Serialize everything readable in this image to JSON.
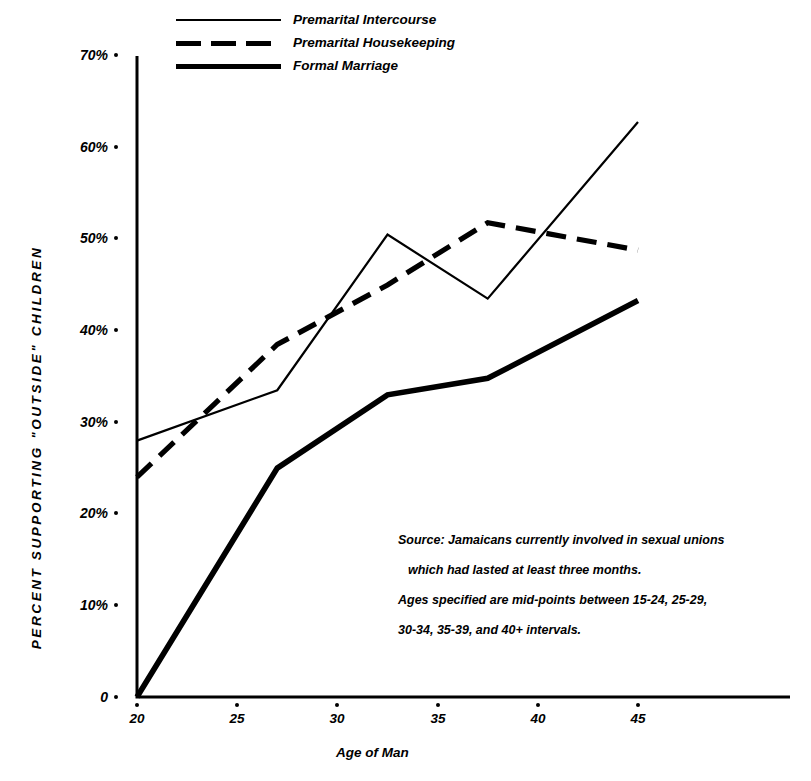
{
  "chart_data": {
    "type": "line",
    "title": "",
    "xlabel": "Age of Man",
    "ylabel": "PERCENT SUPPORTING \"OUTSIDE\" CHILDREN",
    "x": [
      20,
      27,
      32.5,
      37.5,
      45
    ],
    "xlim": [
      20,
      45
    ],
    "ylim": [
      0,
      70
    ],
    "xticks": [
      "20",
      "25",
      "30",
      "35",
      "40",
      "45"
    ],
    "xtick_values": [
      20,
      25,
      30,
      35,
      40,
      45
    ],
    "yticks": [
      "0",
      "10%",
      "20%",
      "30%",
      "40%",
      "50%",
      "60%",
      "70%"
    ],
    "ytick_values": [
      0,
      10,
      20,
      30,
      40,
      50,
      60,
      70
    ],
    "grid": false,
    "legend_position": "top-center",
    "series": [
      {
        "name": "Premarital Intercourse",
        "style": "solid-thin",
        "values": [
          28.0,
          33.5,
          50.5,
          43.5,
          62.8
        ]
      },
      {
        "name": "Premarital Housekeeping",
        "style": "dashed",
        "values": [
          24.0,
          38.5,
          45.0,
          51.8,
          48.8
        ]
      },
      {
        "name": "Formal Marriage",
        "style": "solid-thick",
        "values": [
          0.0,
          25.0,
          33.0,
          34.8,
          43.3
        ]
      }
    ],
    "annotations": [
      "Source: Jamaicans currently involved in sexual unions",
      "which  had lasted at least three months.",
      "Ages specified are mid-points between 15-24, 25-29,",
      "30-34, 35-39, and 40+ intervals."
    ]
  },
  "axes": {
    "y_title": "PERCENT SUPPORTING \"OUTSIDE\" CHILDREN",
    "x_title": "Age of Man"
  },
  "legend": {
    "items": [
      {
        "label": "Premarital Intercourse"
      },
      {
        "label": "Premarital Housekeeping"
      },
      {
        "label": "Formal Marriage"
      }
    ]
  },
  "note": {
    "lines": [
      "Source: Jamaicans currently involved in sexual unions",
      "which  had lasted at least three months.",
      "Ages specified are mid-points between 15-24, 25-29,",
      "30-34, 35-39, and 40+ intervals."
    ]
  },
  "colors": {
    "ink": "#000000",
    "background": "#ffffff"
  }
}
